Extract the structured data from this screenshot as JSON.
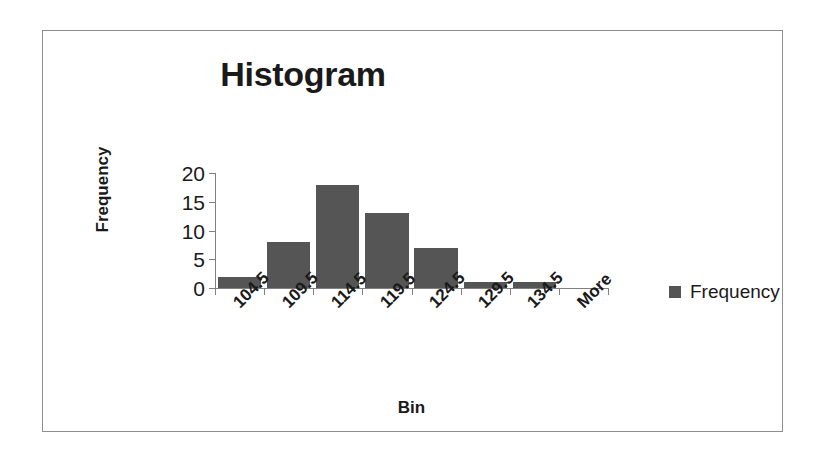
{
  "chart_data": {
    "type": "bar",
    "title": "Histogram",
    "xlabel": "Bin",
    "ylabel": "Frequency",
    "categories": [
      "104.5",
      "109.5",
      "114.5",
      "119.5",
      "124.5",
      "129.5",
      "134.5",
      "More"
    ],
    "values": [
      2,
      8,
      18,
      13,
      7,
      1,
      1,
      0
    ],
    "series": [
      {
        "name": "Frequency",
        "values": [
          2,
          8,
          18,
          13,
          7,
          1,
          1,
          0
        ]
      }
    ],
    "ylim": [
      0,
      20
    ],
    "yticks": [
      20,
      15,
      10,
      5,
      0
    ],
    "grid": false,
    "legend_position": "right",
    "bar_color": "#555555",
    "axis_color": "#808080",
    "text_color": "#1a1a1a",
    "frame_color": "#8e8e8e"
  },
  "legend": {
    "entries": [
      {
        "label": "Frequency",
        "color": "#555555"
      }
    ]
  }
}
